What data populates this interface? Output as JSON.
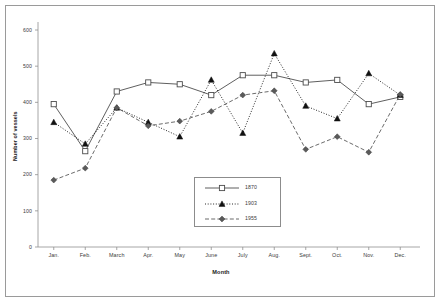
{
  "chart_data": {
    "type": "line",
    "title": "",
    "xlabel": "Month",
    "ylabel": "Number of vessels",
    "categories": [
      "Jan.",
      "Feb.",
      "March",
      "Apr.",
      "May",
      "June",
      "July",
      "Aug.",
      "Sept.",
      "Oct.",
      "Nov.",
      "Dec."
    ],
    "ylim": [
      0,
      600
    ],
    "yticks": [
      0,
      100,
      200,
      300,
      400,
      500,
      600
    ],
    "grid": false,
    "legend_position": "inside-bottom-center",
    "series": [
      {
        "name": "1870",
        "marker": "open-square",
        "line_style": "solid",
        "color": "#4d4d4d",
        "values": [
          395,
          265,
          430,
          455,
          450,
          420,
          475,
          475,
          455,
          462,
          395,
          415
        ]
      },
      {
        "name": "1903",
        "marker": "filled-triangle",
        "line_style": "dotted",
        "color": "#111111",
        "values": [
          345,
          285,
          385,
          345,
          305,
          462,
          315,
          535,
          390,
          355,
          480,
          420
        ]
      },
      {
        "name": "1955",
        "marker": "filled-diamond",
        "line_style": "dashed",
        "color": "#5a5a5a",
        "values": [
          185,
          218,
          385,
          335,
          348,
          375,
          420,
          432,
          270,
          305,
          262,
          422
        ]
      }
    ]
  },
  "legend": {
    "entries": [
      {
        "label": "1870"
      },
      {
        "label": "1903"
      },
      {
        "label": "1955"
      }
    ]
  }
}
